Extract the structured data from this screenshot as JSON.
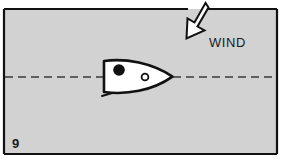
{
  "figure": {
    "number": "9",
    "caption_region_label": "9",
    "background_color": "#d2d2d2",
    "frame_color": "#111111",
    "page_color": "#ffffff",
    "ink_color": "#111111",
    "hull_fill": "#ffffff",
    "arrow_fill": "#ffffff"
  },
  "annotations": {
    "wind_label": "WIND"
  },
  "elements": {
    "wind_arrow_name": "wind-direction-arrow",
    "boat_name": "sailboat-hull",
    "mast_name": "mast-marker",
    "block_name": "sail-block-fitting",
    "boom_name": "boom-line",
    "centerline_name": "course-centerline"
  },
  "geometry": {
    "frame": {
      "x": 4,
      "y": 8,
      "width": 274,
      "height": 147
    },
    "centerline_y": 77,
    "hull": {
      "left": 103,
      "right": 173,
      "top": 60,
      "bottom": 93
    },
    "mast": {
      "cx": 119,
      "cy": 70,
      "r": 6
    },
    "block": {
      "cx": 145,
      "cy": 77,
      "r": 3.4
    },
    "wind_label_pos": {
      "x": 209,
      "y": 47
    },
    "figure_number_pos": {
      "x": 12,
      "y": 148
    }
  }
}
